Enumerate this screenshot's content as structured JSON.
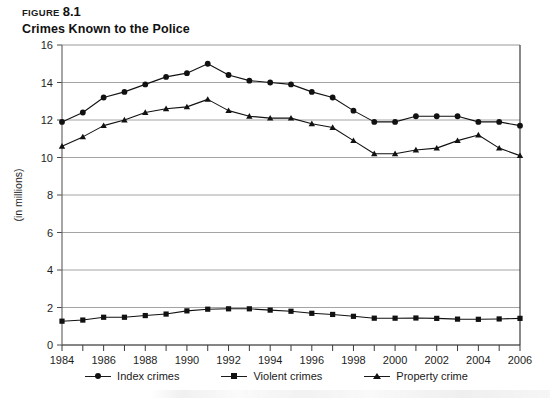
{
  "figure": {
    "label": "FIGURE",
    "number": "8.1",
    "title": "Crimes Known to the Police"
  },
  "legend": {
    "items": [
      {
        "label": "Index crimes",
        "marker": "circle"
      },
      {
        "label": "Violent crimes",
        "marker": "square"
      },
      {
        "label": "Property crime",
        "marker": "triangle"
      }
    ]
  },
  "chart_data": {
    "type": "line",
    "title": "Crimes Known to the Police",
    "xlabel": "",
    "ylabel": "(in millions)",
    "xlim": [
      1984,
      2006
    ],
    "ylim": [
      0,
      16
    ],
    "grid": true,
    "legend_position": "bottom",
    "xticks": [
      1984,
      1985,
      1986,
      1987,
      1988,
      1989,
      1990,
      1991,
      1992,
      1993,
      1994,
      1995,
      1996,
      1997,
      1998,
      1999,
      2000,
      2001,
      2002,
      2003,
      2004,
      2005,
      2006
    ],
    "xtick_labels": [
      "1984",
      "",
      "1986",
      "",
      "1988",
      "",
      "1990",
      "",
      "1992",
      "",
      "1994",
      "",
      "1996",
      "",
      "1998",
      "",
      "2000",
      "",
      "2002",
      "",
      "2004",
      "",
      "2006"
    ],
    "yticks": [
      0,
      2,
      4,
      6,
      8,
      10,
      12,
      14,
      16
    ],
    "ytick_labels": [
      "0",
      "2",
      "4",
      "6",
      "8",
      "10",
      "12",
      "14",
      "16"
    ],
    "x": [
      1984,
      1985,
      1986,
      1987,
      1988,
      1989,
      1990,
      1991,
      1992,
      1993,
      1994,
      1995,
      1996,
      1997,
      1998,
      1999,
      2000,
      2001,
      2002,
      2003,
      2004,
      2005,
      2006
    ],
    "series": [
      {
        "name": "Index crimes",
        "marker": "circle",
        "values": [
          11.9,
          12.4,
          13.2,
          13.5,
          13.9,
          14.3,
          14.5,
          15.0,
          14.4,
          14.1,
          14.0,
          13.9,
          13.5,
          13.2,
          12.5,
          11.9,
          11.9,
          12.2,
          12.2,
          12.2,
          11.9,
          11.9,
          11.7
        ]
      },
      {
        "name": "Violent crimes",
        "marker": "square",
        "values": [
          1.27,
          1.33,
          1.48,
          1.48,
          1.57,
          1.65,
          1.82,
          1.91,
          1.93,
          1.93,
          1.86,
          1.8,
          1.69,
          1.63,
          1.53,
          1.43,
          1.43,
          1.44,
          1.42,
          1.38,
          1.37,
          1.39,
          1.42
        ]
      },
      {
        "name": "Property crime",
        "marker": "triangle",
        "values": [
          10.6,
          11.1,
          11.7,
          12.0,
          12.4,
          12.6,
          12.7,
          13.1,
          12.5,
          12.2,
          12.1,
          12.1,
          11.8,
          11.6,
          10.9,
          10.2,
          10.2,
          10.4,
          10.5,
          10.9,
          11.2,
          10.5,
          10.1
        ]
      }
    ]
  },
  "axes": {
    "y_axis_title": "(in millions)"
  }
}
